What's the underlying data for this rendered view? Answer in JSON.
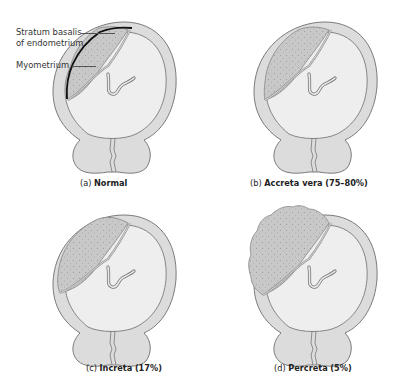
{
  "colors": {
    "myometrium": "#dcdcdc",
    "cavity": "#eeeeee",
    "outline": "#7a7a7a",
    "placenta": "#c4c4c4",
    "placenta_dots": "#9a9a9a",
    "basalis_line": "#111111",
    "text": "#222222"
  },
  "labels": {
    "stratum_basalis_line1": "Stratum basalis",
    "stratum_basalis_line2": "of endometrium",
    "myometrium": "Myometrium"
  },
  "panels": [
    {
      "id": "a",
      "prefix": "(a)",
      "title": "Normal",
      "percent": ""
    },
    {
      "id": "b",
      "prefix": "(b)",
      "title": "Accreta vera",
      "percent": "(75–80%)"
    },
    {
      "id": "c",
      "prefix": "(c)",
      "title": "Increta",
      "percent": "(17%)"
    },
    {
      "id": "d",
      "prefix": "(d)",
      "title": "Percreta",
      "percent": "(5%)"
    }
  ]
}
